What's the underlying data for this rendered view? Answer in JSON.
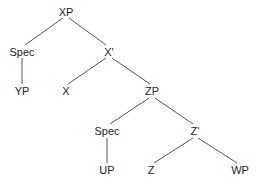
{
  "tree": {
    "nodes": [
      {
        "id": "xp",
        "label": "XP",
        "x": 66,
        "y": 12
      },
      {
        "id": "spec1",
        "label": "Spec",
        "x": 22,
        "y": 52
      },
      {
        "id": "xbar",
        "label": "X'",
        "x": 109,
        "y": 52
      },
      {
        "id": "yp",
        "label": "YP",
        "x": 22,
        "y": 91
      },
      {
        "id": "x",
        "label": "X",
        "x": 66,
        "y": 91
      },
      {
        "id": "zp",
        "label": "ZP",
        "x": 152,
        "y": 91
      },
      {
        "id": "spec2",
        "label": "Spec",
        "x": 107,
        "y": 131
      },
      {
        "id": "zbar",
        "label": "Z'",
        "x": 195,
        "y": 131
      },
      {
        "id": "up",
        "label": "UP",
        "x": 107,
        "y": 170
      },
      {
        "id": "z",
        "label": "Z",
        "x": 151,
        "y": 170
      },
      {
        "id": "wp",
        "label": "WP",
        "x": 240,
        "y": 170
      }
    ],
    "edges": [
      [
        "xp",
        "spec1"
      ],
      [
        "xp",
        "xbar"
      ],
      [
        "spec1",
        "yp"
      ],
      [
        "xbar",
        "x"
      ],
      [
        "xbar",
        "zp"
      ],
      [
        "zp",
        "spec2"
      ],
      [
        "zp",
        "zbar"
      ],
      [
        "spec2",
        "up"
      ],
      [
        "zbar",
        "z"
      ],
      [
        "zbar",
        "wp"
      ]
    ]
  },
  "colors": {
    "line": "#555555",
    "text": "#222222"
  }
}
